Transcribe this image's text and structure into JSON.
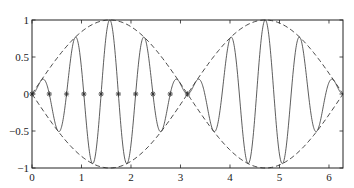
{
  "chart_data": {
    "type": "line",
    "title": "",
    "xlabel": "",
    "ylabel": "",
    "xlim": [
      0,
      6.2832
    ],
    "ylim": [
      -1,
      1
    ],
    "grid": false,
    "legend": null,
    "x_ticks": [
      0,
      1,
      2,
      3,
      4,
      5,
      6
    ],
    "x_tick_labels": [
      "0",
      "1",
      "2",
      "3",
      "4",
      "5",
      "6"
    ],
    "y_ticks": [
      -1,
      -0.5,
      0,
      0.5,
      1
    ],
    "y_tick_labels": [
      "-1",
      "-0.5",
      "0",
      "0.5",
      "1"
    ],
    "series": [
      {
        "name": "sin(x)*sin(9x)",
        "style": "solid",
        "color": "#333333",
        "function": "sin(x)*sin(9*x)",
        "x_range": [
          0,
          6.2832
        ],
        "samples": 900
      },
      {
        "name": "sin(x) envelope",
        "style": "dashed",
        "color": "#333333",
        "function": "sin(x)",
        "x_range": [
          0,
          6.2832
        ],
        "samples": 200
      },
      {
        "name": "-sin(x) envelope",
        "style": "dashed",
        "color": "#333333",
        "function": "-sin(x)",
        "x_range": [
          0,
          6.2832
        ],
        "samples": 200
      },
      {
        "name": "zeros",
        "style": "markers",
        "marker": "asterisk",
        "color": "#333333",
        "x": [
          0,
          0.3491,
          0.6981,
          1.0472,
          1.3963,
          1.7453,
          2.0944,
          2.4435,
          2.7925,
          3.1416
        ],
        "y": [
          0,
          0,
          0,
          0,
          0,
          0,
          0,
          0,
          0,
          0
        ]
      }
    ]
  },
  "axes": {
    "left": 32,
    "top": 20,
    "right": 343,
    "bottom": 168
  }
}
